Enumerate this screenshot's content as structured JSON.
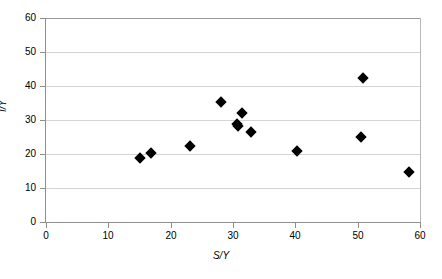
{
  "chart_data": {
    "type": "scatter",
    "title": "",
    "xlabel": "S/Y",
    "ylabel": "I/Y",
    "xlim": [
      0,
      60
    ],
    "ylim": [
      0,
      60
    ],
    "xticks": [
      0,
      10,
      20,
      30,
      40,
      50,
      60
    ],
    "yticks": [
      0,
      10,
      20,
      30,
      40,
      50,
      60
    ],
    "xtick_labels": [
      "0",
      "10",
      "20",
      "30",
      "40",
      "50",
      "60"
    ],
    "ytick_labels": [
      "0",
      "10",
      "20",
      "30",
      "40",
      "50",
      "60"
    ],
    "grid": "horizontal",
    "legend": "none",
    "marker": "diamond",
    "marker_color": "#000000",
    "grid_color": "#d4d4d4",
    "axis_color": "#8e8e8e",
    "background": "#ffffff",
    "points": [
      {
        "x": 15.0,
        "y": 18.7
      },
      {
        "x": 16.9,
        "y": 20.2
      },
      {
        "x": 23.1,
        "y": 22.4
      },
      {
        "x": 28.1,
        "y": 35.4
      },
      {
        "x": 30.6,
        "y": 28.9
      },
      {
        "x": 30.8,
        "y": 28.3
      },
      {
        "x": 31.5,
        "y": 32.0
      },
      {
        "x": 32.8,
        "y": 26.4
      },
      {
        "x": 40.3,
        "y": 20.8
      },
      {
        "x": 50.6,
        "y": 24.9
      },
      {
        "x": 50.9,
        "y": 42.4
      },
      {
        "x": 58.3,
        "y": 14.6
      }
    ]
  }
}
